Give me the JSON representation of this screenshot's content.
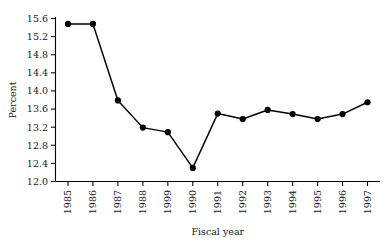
{
  "chart_data": {
    "type": "line",
    "title": "",
    "xlabel": "Fiscal year",
    "ylabel": "Percent",
    "categories": [
      "1985",
      "1986",
      "1987",
      "1988",
      "1999",
      "1990",
      "1991",
      "1992",
      "1993",
      "1994",
      "1995",
      "1996",
      "1997"
    ],
    "values": [
      15.48,
      15.48,
      13.79,
      13.19,
      13.09,
      12.3,
      13.5,
      13.38,
      13.58,
      13.49,
      13.38,
      13.49,
      13.75
    ],
    "series": [
      {
        "name": "Percent",
        "values": [
          15.48,
          15.48,
          13.79,
          13.19,
          13.09,
          12.3,
          13.5,
          13.38,
          13.58,
          13.49,
          13.38,
          13.49,
          13.75
        ]
      }
    ],
    "ylim": [
      12.0,
      15.6
    ],
    "ytick_labels": [
      "12.0",
      "12.4",
      "12.8",
      "13.2",
      "13.6",
      "14.0",
      "14.4",
      "14.8",
      "15.2",
      "15.6"
    ],
    "ytick_values": [
      12.0,
      12.4,
      12.8,
      13.2,
      13.6,
      14.0,
      14.4,
      14.8,
      15.2,
      15.6
    ],
    "grid": false,
    "legend": "none",
    "marker": "filled-circle",
    "line_color": "#000000",
    "marker_color": "#000000",
    "axis_color": "#000000",
    "background": "#ffffff",
    "xtick_rotation": 90
  }
}
